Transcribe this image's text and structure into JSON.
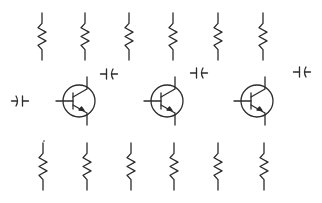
{
  "diagram": {
    "type": "circuit-component-palette",
    "stroke_color": "#2b2b2b",
    "background": "#ffffff",
    "resistors_top": [
      {
        "x": 42,
        "y1": 13,
        "y2": 60
      },
      {
        "x": 85,
        "y1": 13,
        "y2": 60
      },
      {
        "x": 129,
        "y1": 13,
        "y2": 60
      },
      {
        "x": 173,
        "y1": 13,
        "y2": 60
      },
      {
        "x": 218,
        "y1": 13,
        "y2": 60
      },
      {
        "x": 263,
        "y1": 13,
        "y2": 60
      }
    ],
    "resistors_bottom": [
      {
        "x": 43,
        "y1": 143,
        "y2": 190
      },
      {
        "x": 87,
        "y1": 143,
        "y2": 190
      },
      {
        "x": 131,
        "y1": 143,
        "y2": 190
      },
      {
        "x": 174,
        "y1": 143,
        "y2": 190
      },
      {
        "x": 218,
        "y1": 143,
        "y2": 190
      },
      {
        "x": 264,
        "y1": 143,
        "y2": 190
      }
    ],
    "transistors": [
      {
        "cx": 79,
        "cy": 101,
        "r": 16,
        "type": "NPN"
      },
      {
        "cx": 167,
        "cy": 101,
        "r": 16,
        "type": "NPN"
      },
      {
        "cx": 257,
        "cy": 101,
        "r": 16,
        "type": "NPN"
      }
    ],
    "capacitors": [
      {
        "cx": 20,
        "cy": 101,
        "orientation": "curved-left",
        "kind": "polarized"
      },
      {
        "cx": 109,
        "cy": 74,
        "orientation": "curved-right",
        "kind": "polarized"
      },
      {
        "cx": 199,
        "cy": 73,
        "orientation": "curved-right",
        "kind": "polarized"
      },
      {
        "cx": 302,
        "cy": 72,
        "orientation": "curved-right",
        "kind": "polarized"
      }
    ],
    "counts": {
      "resistors": 12,
      "transistors": 3,
      "capacitors": 4
    }
  }
}
